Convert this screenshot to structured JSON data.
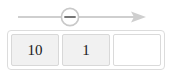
{
  "canvas": {
    "width": 180,
    "height": 77,
    "background": "#ffffff"
  },
  "arrow": {
    "name": "right-arrow-with-minus-marker",
    "direction": "right",
    "line_color": "#cfcfcf",
    "marker": {
      "icon": "circle-minus-icon",
      "shape": "circle",
      "symbol": "−",
      "stroke_color": "#c9c9c9",
      "fill_color": "#ffffff",
      "center_x": 70,
      "center_y": 17,
      "radius": 9
    },
    "line_start_x": 18,
    "line_end_x": 146,
    "line_y": 17
  },
  "cell_strip": {
    "name": "value-cell-strip",
    "border_color": "#dcdcdc",
    "cells": [
      {
        "value": "10",
        "filled": true
      },
      {
        "value": "1",
        "filled": true
      },
      {
        "value": "",
        "filled": false
      }
    ]
  }
}
